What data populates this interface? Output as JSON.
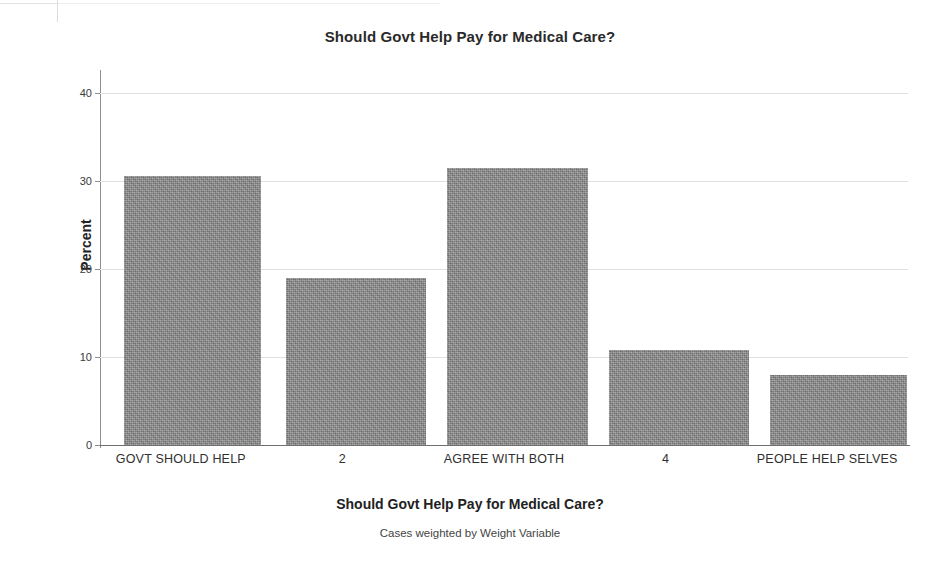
{
  "chart_data": {
    "type": "bar",
    "title": "Should Govt Help Pay for Medical Care?",
    "xlabel": "Should Govt Help Pay for Medical Care?",
    "ylabel": "Percent",
    "footnote": "Cases weighted by Weight Variable",
    "categories": [
      "GOVT SHOULD HELP",
      "2",
      "AGREE WITH BOTH",
      "4",
      "PEOPLE HELP SELVES"
    ],
    "values": [
      30.5,
      19.0,
      31.5,
      10.8,
      7.9
    ],
    "ylim": [
      0,
      42
    ],
    "yticks": [
      0,
      10,
      20,
      30,
      40
    ],
    "ytick_labels": [
      "0",
      "10",
      "20",
      "30",
      "40"
    ],
    "grid": true,
    "legend": "none",
    "bar_color": "#8c8c8c",
    "gridline_color": "#dfe0e2",
    "axis_color": "#8d8d8d"
  }
}
